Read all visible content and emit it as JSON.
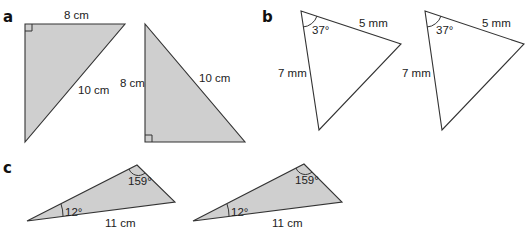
{
  "parts": {
    "a": {
      "label": "a",
      "triangles": [
        {
          "fill": "shaded",
          "right_angle": "top-left",
          "sides": {
            "top": "8 cm",
            "hypotenuse": "10 cm"
          }
        },
        {
          "fill": "shaded",
          "right_angle": "bottom-left",
          "sides": {
            "left": "8 cm",
            "hypotenuse": "10 cm"
          }
        }
      ]
    },
    "b": {
      "label": "b",
      "triangles": [
        {
          "fill": "white",
          "angle": "37°",
          "sides": {
            "top": "5 mm",
            "left": "7 mm"
          }
        },
        {
          "fill": "white",
          "angle": "37°",
          "sides": {
            "top": "5 mm",
            "left": "7 mm"
          }
        }
      ]
    },
    "c": {
      "label": "c",
      "triangles": [
        {
          "fill": "shaded",
          "angles": [
            "12°",
            "159°"
          ],
          "sides": {
            "bottom": "11 cm"
          }
        },
        {
          "fill": "shaded",
          "angles": [
            "12°",
            "159°"
          ],
          "sides": {
            "bottom": "11 cm"
          }
        }
      ]
    }
  },
  "colors": {
    "shade": "#cfcfcf",
    "stroke": "#333333"
  }
}
